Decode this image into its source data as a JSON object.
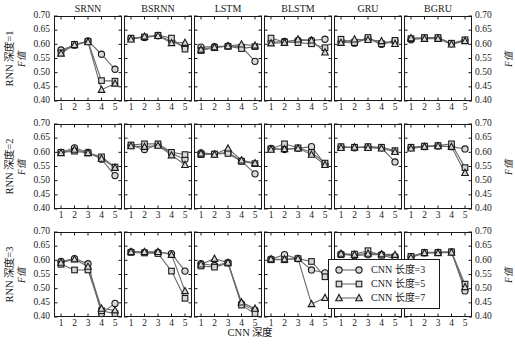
{
  "figure": {
    "x_axis_caption": "CNN 深度",
    "y_axis_caption": "F值",
    "y_ticks": [
      "0.70",
      "0.65",
      "0.60",
      "0.55",
      "0.50",
      "0.45",
      "0.40"
    ],
    "x_ticks": [
      "1",
      "2",
      "3",
      "4",
      "5"
    ],
    "ylim": [
      0.4,
      0.7
    ],
    "xlim": [
      1,
      5
    ],
    "column_titles": [
      "SRNN",
      "BSRNN",
      "LSTM",
      "BLSTM",
      "GRU",
      "BGRU"
    ],
    "row_labels": [
      "RNN 深度=1",
      "RNN 深度=2",
      "RNN 深度=3"
    ],
    "row_sublabel": "F值"
  },
  "legend": {
    "position": "bottom-right",
    "items": [
      {
        "label": "CNN 长度=3",
        "marker": "circle"
      },
      {
        "label": "CNN 长度=5",
        "marker": "square"
      },
      {
        "label": "CNN 长度=7",
        "marker": "triangle"
      }
    ]
  },
  "style": {
    "line_color": "#6b6b6b",
    "marker_edge": "#1a1a1a",
    "marker_fill": "#d8d8d8",
    "axis_color": "#1a1a1a"
  },
  "chart_data": {
    "type": "line",
    "title": "",
    "xlabel": "CNN 深度",
    "ylabel": "F值",
    "xlim": [
      1,
      5
    ],
    "ylim": [
      0.4,
      0.7
    ],
    "grid": false,
    "x": [
      1,
      2,
      3,
      4,
      5
    ],
    "legend_position": "bottom-right",
    "panel_rows": [
      "RNN 深度=1",
      "RNN 深度=2",
      "RNN 深度=3"
    ],
    "panel_columns": [
      "SRNN",
      "BSRNN",
      "LSTM",
      "BLSTM",
      "GRU",
      "BGRU"
    ],
    "panels": [
      {
        "row": "RNN 深度=1",
        "column": "SRNN",
        "series": [
          {
            "name": "CNN 长度=3",
            "marker": "circle",
            "values": [
              0.58,
              0.597,
              0.612,
              0.565,
              0.512
            ]
          },
          {
            "name": "CNN 长度=5",
            "marker": "square",
            "values": [
              0.57,
              0.6,
              0.61,
              0.472,
              0.47
            ]
          },
          {
            "name": "CNN 长度=7",
            "marker": "triangle",
            "values": [
              0.568,
              0.598,
              0.608,
              0.44,
              0.462
            ]
          }
        ]
      },
      {
        "row": "RNN 深度=1",
        "column": "BSRNN",
        "series": [
          {
            "name": "CNN 长度=3",
            "marker": "circle",
            "values": [
              0.62,
              0.624,
              0.63,
              0.612,
              0.59
            ]
          },
          {
            "name": "CNN 长度=5",
            "marker": "square",
            "values": [
              0.622,
              0.626,
              0.632,
              0.622,
              0.583
            ]
          },
          {
            "name": "CNN 长度=7",
            "marker": "triangle",
            "values": [
              0.618,
              0.628,
              0.63,
              0.605,
              0.606
            ]
          }
        ]
      },
      {
        "row": "RNN 深度=1",
        "column": "LSTM",
        "series": [
          {
            "name": "CNN 长度=3",
            "marker": "circle",
            "values": [
              0.59,
              0.592,
              0.594,
              0.592,
              0.54
            ]
          },
          {
            "name": "CNN 长度=5",
            "marker": "square",
            "values": [
              0.578,
              0.588,
              0.593,
              0.585,
              0.592
            ]
          },
          {
            "name": "CNN 长度=7",
            "marker": "triangle",
            "values": [
              0.582,
              0.59,
              0.594,
              0.6,
              0.596
            ]
          }
        ]
      },
      {
        "row": "RNN 深度=1",
        "column": "BLSTM",
        "series": [
          {
            "name": "CNN 长度=3",
            "marker": "circle",
            "values": [
              0.607,
              0.61,
              0.614,
              0.614,
              0.618
            ]
          },
          {
            "name": "CNN 长度=5",
            "marker": "square",
            "values": [
              0.622,
              0.608,
              0.606,
              0.602,
              0.588
            ]
          },
          {
            "name": "CNN 长度=7",
            "marker": "triangle",
            "values": [
              0.604,
              0.606,
              0.618,
              0.614,
              0.572
            ]
          }
        ]
      },
      {
        "row": "RNN 深度=1",
        "column": "GRU",
        "series": [
          {
            "name": "CNN 长度=3",
            "marker": "circle",
            "values": [
              0.608,
              0.604,
              0.62,
              0.6,
              0.612
            ]
          },
          {
            "name": "CNN 长度=5",
            "marker": "square",
            "values": [
              0.618,
              0.606,
              0.624,
              0.602,
              0.614
            ]
          },
          {
            "name": "CNN 长度=7",
            "marker": "triangle",
            "values": [
              0.606,
              0.618,
              0.616,
              0.612,
              0.602
            ]
          }
        ]
      },
      {
        "row": "RNN 深度=1",
        "column": "BGRU",
        "series": [
          {
            "name": "CNN 长度=3",
            "marker": "circle",
            "values": [
              0.616,
              0.622,
              0.622,
              0.602,
              0.614
            ]
          },
          {
            "name": "CNN 长度=5",
            "marker": "square",
            "values": [
              0.62,
              0.624,
              0.624,
              0.604,
              0.616
            ]
          },
          {
            "name": "CNN 长度=7",
            "marker": "triangle",
            "values": [
              0.622,
              0.62,
              0.62,
              0.6,
              0.612
            ]
          }
        ]
      },
      {
        "row": "RNN 深度=2",
        "column": "SRNN",
        "series": [
          {
            "name": "CNN 长度=3",
            "marker": "circle",
            "values": [
              0.6,
              0.616,
              0.6,
              0.576,
              0.518
            ]
          },
          {
            "name": "CNN 长度=5",
            "marker": "square",
            "values": [
              0.6,
              0.604,
              0.598,
              0.584,
              0.548
            ]
          },
          {
            "name": "CNN 长度=7",
            "marker": "triangle",
            "values": [
              0.598,
              0.61,
              0.598,
              0.578,
              0.546
            ]
          }
        ]
      },
      {
        "row": "RNN 深度=2",
        "column": "BSRNN",
        "series": [
          {
            "name": "CNN 长度=3",
            "marker": "circle",
            "values": [
              0.624,
              0.61,
              0.626,
              0.596,
              0.576
            ]
          },
          {
            "name": "CNN 长度=5",
            "marker": "square",
            "values": [
              0.626,
              0.63,
              0.63,
              0.6,
              0.592
            ]
          },
          {
            "name": "CNN 长度=7",
            "marker": "triangle",
            "values": [
              0.622,
              0.62,
              0.624,
              0.59,
              0.556
            ]
          }
        ]
      },
      {
        "row": "RNN 深度=2",
        "column": "LSTM",
        "series": [
          {
            "name": "CNN 长度=3",
            "marker": "circle",
            "values": [
              0.598,
              0.594,
              0.6,
              0.57,
              0.524
            ]
          },
          {
            "name": "CNN 长度=5",
            "marker": "square",
            "values": [
              0.592,
              0.594,
              0.596,
              0.568,
              0.56
            ]
          },
          {
            "name": "CNN 长度=7",
            "marker": "triangle",
            "values": [
              0.596,
              0.592,
              0.614,
              0.572,
              0.562
            ]
          }
        ]
      },
      {
        "row": "RNN 深度=2",
        "column": "BLSTM",
        "series": [
          {
            "name": "CNN 长度=3",
            "marker": "circle",
            "values": [
              0.614,
              0.61,
              0.614,
              0.62,
              0.558
            ]
          },
          {
            "name": "CNN 长度=5",
            "marker": "square",
            "values": [
              0.612,
              0.63,
              0.616,
              0.6,
              0.562
            ]
          },
          {
            "name": "CNN 长度=7",
            "marker": "triangle",
            "values": [
              0.61,
              0.612,
              0.614,
              0.592,
              0.556
            ]
          }
        ]
      },
      {
        "row": "RNN 深度=2",
        "column": "GRU",
        "series": [
          {
            "name": "CNN 长度=3",
            "marker": "circle",
            "values": [
              0.618,
              0.616,
              0.618,
              0.616,
              0.566
            ]
          },
          {
            "name": "CNN 长度=5",
            "marker": "square",
            "values": [
              0.62,
              0.618,
              0.62,
              0.618,
              0.606
            ]
          },
          {
            "name": "CNN 长度=7",
            "marker": "triangle",
            "values": [
              0.616,
              0.618,
              0.616,
              0.614,
              0.602
            ]
          }
        ]
      },
      {
        "row": "RNN 深度=2",
        "column": "BGRU",
        "series": [
          {
            "name": "CNN 长度=3",
            "marker": "circle",
            "values": [
              0.616,
              0.62,
              0.622,
              0.62,
              0.612
            ]
          },
          {
            "name": "CNN 长度=5",
            "marker": "square",
            "values": [
              0.618,
              0.622,
              0.624,
              0.63,
              0.546
            ]
          },
          {
            "name": "CNN 长度=7",
            "marker": "triangle",
            "values": [
              0.614,
              0.62,
              0.622,
              0.62,
              0.528
            ]
          }
        ]
      },
      {
        "row": "RNN 深度=3",
        "column": "SRNN",
        "series": [
          {
            "name": "CNN 长度=3",
            "marker": "circle",
            "values": [
              0.596,
              0.606,
              0.588,
              0.412,
              0.448
            ]
          },
          {
            "name": "CNN 长度=5",
            "marker": "square",
            "values": [
              0.586,
              0.566,
              0.566,
              0.422,
              0.412
            ]
          },
          {
            "name": "CNN 长度=7",
            "marker": "triangle",
            "values": [
              0.592,
              0.604,
              0.578,
              0.43,
              0.424
            ]
          }
        ]
      },
      {
        "row": "RNN 深度=3",
        "column": "BSRNN",
        "series": [
          {
            "name": "CNN 长度=3",
            "marker": "circle",
            "values": [
              0.63,
              0.628,
              0.628,
              0.624,
              0.562
            ]
          },
          {
            "name": "CNN 长度=5",
            "marker": "square",
            "values": [
              0.628,
              0.626,
              0.624,
              0.562,
              0.466
            ]
          },
          {
            "name": "CNN 长度=7",
            "marker": "triangle",
            "values": [
              0.63,
              0.63,
              0.63,
              0.62,
              0.492
            ]
          }
        ]
      },
      {
        "row": "RNN 深度=3",
        "column": "LSTM",
        "series": [
          {
            "name": "CNN 长度=3",
            "marker": "circle",
            "values": [
              0.588,
              0.582,
              0.592,
              0.446,
              0.424
            ]
          },
          {
            "name": "CNN 长度=5",
            "marker": "square",
            "values": [
              0.58,
              0.576,
              0.59,
              0.442,
              0.412
            ]
          },
          {
            "name": "CNN 长度=7",
            "marker": "triangle",
            "values": [
              0.586,
              0.606,
              0.592,
              0.452,
              0.43
            ]
          }
        ]
      },
      {
        "row": "RNN 深度=3",
        "column": "BLSTM",
        "series": [
          {
            "name": "CNN 长度=3",
            "marker": "circle",
            "values": [
              0.604,
              0.62,
              0.606,
              0.566,
              0.556
            ]
          },
          {
            "name": "CNN 长度=5",
            "marker": "square",
            "values": [
              0.602,
              0.602,
              0.606,
              0.596,
              0.542
            ]
          },
          {
            "name": "CNN 长度=7",
            "marker": "triangle",
            "values": [
              0.604,
              0.604,
              0.606,
              0.446,
              0.468
            ]
          }
        ]
      },
      {
        "row": "RNN 深度=3",
        "column": "GRU",
        "series": [
          {
            "name": "CNN 长度=3",
            "marker": "circle",
            "values": [
              0.622,
              0.616,
              0.62,
              0.62,
              0.614
            ]
          },
          {
            "name": "CNN 长度=5",
            "marker": "square",
            "values": [
              0.62,
              0.622,
              0.634,
              0.618,
              0.606
            ]
          },
          {
            "name": "CNN 长度=7",
            "marker": "triangle",
            "values": [
              0.624,
              0.62,
              0.624,
              0.622,
              0.62
            ]
          }
        ]
      },
      {
        "row": "RNN 深度=3",
        "column": "BGRU",
        "series": [
          {
            "name": "CNN 长度=3",
            "marker": "circle",
            "values": [
              0.612,
              0.626,
              0.628,
              0.63,
              0.492
            ]
          },
          {
            "name": "CNN 长度=5",
            "marker": "square",
            "values": [
              0.614,
              0.628,
              0.628,
              0.63,
              0.516
            ]
          },
          {
            "name": "CNN 长度=7",
            "marker": "triangle",
            "values": [
              0.61,
              0.626,
              0.626,
              0.628,
              0.506
            ]
          }
        ]
      }
    ]
  }
}
